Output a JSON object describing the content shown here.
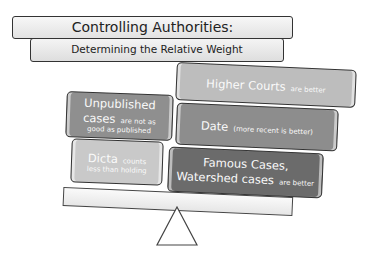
{
  "title": {
    "main": "Controlling Authorities:",
    "subtitle": "Determining the Relative Weight"
  },
  "left_side": [
    {
      "emphasis": "Unpublished cases",
      "rest": "are not as good as published",
      "color": "#8f8f8f"
    },
    {
      "emphasis": "Dicta",
      "rest": "counts less than holding",
      "color": "#c9c9c9"
    }
  ],
  "right_side": [
    {
      "emphasis": "Higher Courts",
      "rest": "are better",
      "color": "#bdbdbd"
    },
    {
      "emphasis": "Date",
      "rest": "(more recent is better)",
      "color": "#8d8d8d"
    },
    {
      "emphasis": "Famous Cases, Watershed cases",
      "rest": "are better",
      "color": "#6b6b6b"
    }
  ],
  "icons": {
    "scale_beam": "balance-beam",
    "fulcrum": "triangle-fulcrum"
  }
}
